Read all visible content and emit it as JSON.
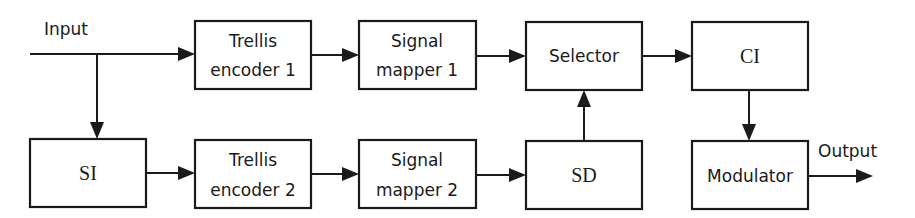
{
  "diagram": {
    "type": "block-diagram",
    "labels": {
      "input": "Input",
      "output": "Output"
    },
    "blocks": {
      "trellis_encoder_1": {
        "line1": "Trellis",
        "line2": "encoder 1"
      },
      "signal_mapper_1": {
        "line1": "Signal",
        "line2": "mapper 1"
      },
      "selector": {
        "label": "Selector"
      },
      "ci": {
        "label": "CI"
      },
      "si": {
        "label": "SI"
      },
      "trellis_encoder_2": {
        "line1": "Trellis",
        "line2": "encoder 2"
      },
      "signal_mapper_2": {
        "line1": "Signal",
        "line2": "mapper 2"
      },
      "sd": {
        "label": "SD"
      },
      "modulator": {
        "label": "Modulator"
      }
    },
    "edges": [
      [
        "Input",
        "Trellis encoder 1"
      ],
      [
        "Input",
        "SI"
      ],
      [
        "Trellis encoder 1",
        "Signal mapper 1"
      ],
      [
        "Signal mapper 1",
        "Selector"
      ],
      [
        "Selector",
        "CI"
      ],
      [
        "CI",
        "Modulator"
      ],
      [
        "Modulator",
        "Output"
      ],
      [
        "SI",
        "Trellis encoder 2"
      ],
      [
        "Trellis encoder 2",
        "Signal mapper 2"
      ],
      [
        "Signal mapper 2",
        "SD"
      ],
      [
        "SD",
        "Selector"
      ]
    ]
  }
}
